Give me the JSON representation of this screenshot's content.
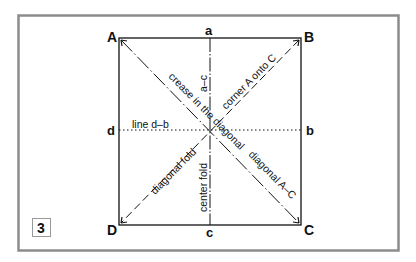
{
  "figure": {
    "step_number": "3",
    "corners": {
      "A": "A",
      "B": "B",
      "C": "C",
      "D": "D"
    },
    "midpoints": {
      "a": "a",
      "b": "b",
      "c": "c",
      "d": "d"
    },
    "fold_labels": {
      "vertical_top": "a–c",
      "vertical_bottom": "center fold",
      "horizontal": "line d–b",
      "diagonal_AC_upper": "crease in the diagonal",
      "diagonal_AC_lower": "diagonal A–C",
      "diagonal_BD_upper": "corner A onto C",
      "diagonal_BD_lower": "diagonal fold"
    },
    "colors": {
      "frame": "#8c8c8c",
      "lines": "#111111",
      "background": "#ffffff"
    }
  }
}
